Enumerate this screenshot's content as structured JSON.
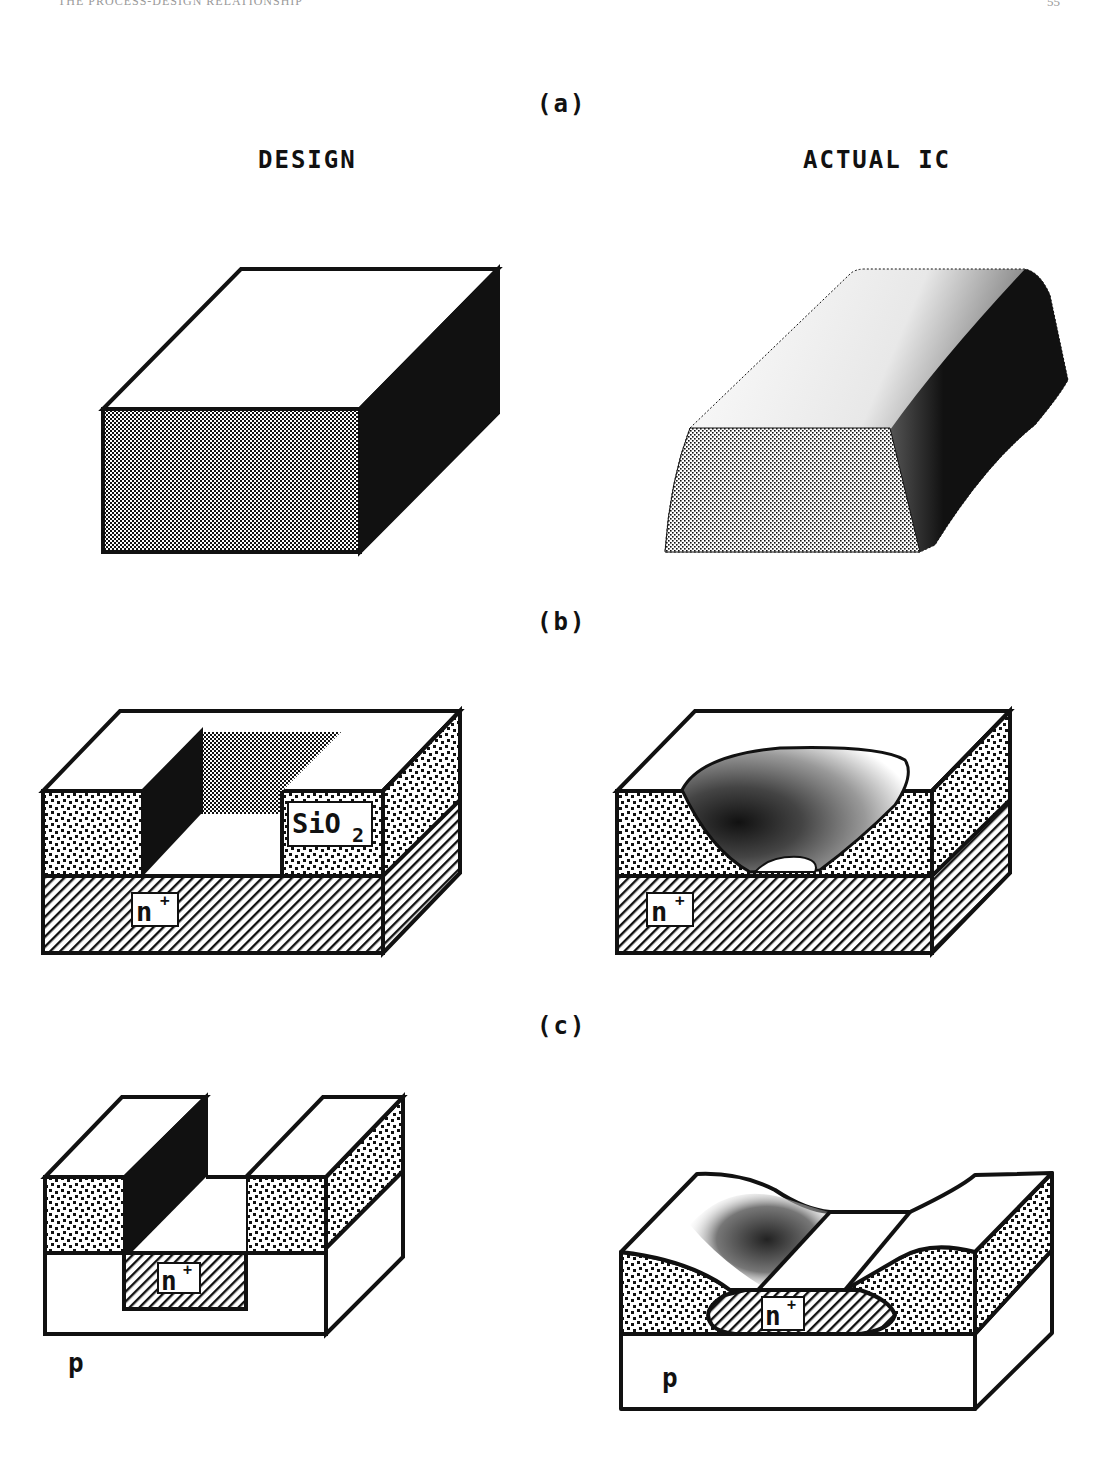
{
  "page_header": {
    "running_title": "THE PROCESS-DESIGN RELATIONSHIP",
    "page_number": "55"
  },
  "columns": {
    "left": "DESIGN",
    "right": "ACTUAL IC"
  },
  "panels": [
    {
      "id": "a",
      "label": "(a)",
      "design": "Ideal rectangular block with sharp edges",
      "actual": "Block with rounded edges and sloped sidewalls"
    },
    {
      "id": "b",
      "label": "(b)",
      "design_labels": {
        "oxide": "SiO",
        "oxide_sub": "2",
        "substrate": "n",
        "substrate_sup": "+"
      },
      "actual_labels": {
        "substrate": "n",
        "substrate_sup": "+"
      }
    },
    {
      "id": "c",
      "label": "(c)",
      "design_labels": {
        "well": "n",
        "well_sup": "+",
        "substrate": "p"
      },
      "actual_labels": {
        "well": "n",
        "well_sup": "+",
        "substrate": "p"
      }
    }
  ],
  "colors": {
    "ink": "#111111",
    "paper": "#ffffff"
  }
}
